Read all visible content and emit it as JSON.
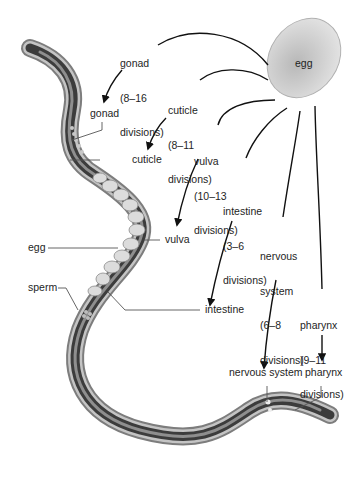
{
  "diagram": {
    "source_label": "egg",
    "precursors": [
      {
        "id": "gonad",
        "name": "gonad",
        "range": "(8–16",
        "unit": "divisions)"
      },
      {
        "id": "cuticle",
        "name": "cuticle",
        "range": "(8–11",
        "unit": "divisions)"
      },
      {
        "id": "vulva",
        "name": "vulva",
        "range": "(10–13",
        "unit": "divisions)"
      },
      {
        "id": "intestine",
        "name": "intestine",
        "range": "(3–6",
        "unit": "divisions)"
      },
      {
        "id": "nervous",
        "name": "nervous",
        "name2": "system",
        "range": "(6–8",
        "unit": "divisions)"
      },
      {
        "id": "pharynx",
        "name": "pharynx",
        "range": "(9–11",
        "unit": "divisions)"
      }
    ],
    "anatomy_labels": {
      "gonad": "gonad",
      "cuticle": "cuticle",
      "vulva": "vulva",
      "egg": "egg",
      "sperm": "sperm",
      "intestine": "intestine",
      "nervous_system": "nervous system",
      "pharynx": "pharynx"
    },
    "colors": {
      "line": "#111111",
      "worm_outer": "#8a8a8a",
      "worm_inner": "#3a3a3a",
      "egg_fill": "#d0d0d0"
    }
  }
}
